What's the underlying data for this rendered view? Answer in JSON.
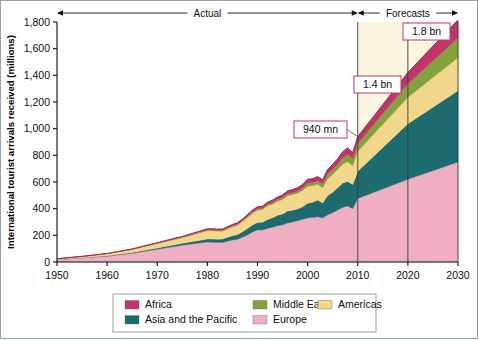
{
  "chart_data": {
    "type": "area",
    "stacked": true,
    "title": "",
    "xlabel": "",
    "ylabel": "International tourist arrivals received (millions)",
    "xlim": [
      1950,
      2030
    ],
    "ylim": [
      0,
      1800
    ],
    "grid": false,
    "legend_position": "bottom",
    "y_ticks": [
      "0",
      "200",
      "400",
      "600",
      "800",
      "1,000",
      "1,200",
      "1,400",
      "1,600",
      "1,800"
    ],
    "y_tick_values": [
      0,
      200,
      400,
      600,
      800,
      1000,
      1200,
      1400,
      1600,
      1800
    ],
    "x_ticks": [
      "1950",
      "1960",
      "1970",
      "1980",
      "1990",
      "2000",
      "2010",
      "2020",
      "2030"
    ],
    "x_tick_values": [
      1950,
      1960,
      1970,
      1980,
      1990,
      2000,
      2010,
      2020,
      2030
    ],
    "stack_order_bottom_to_top": [
      "Europe",
      "Asia and the Pacific",
      "Americas",
      "Middle East",
      "Africa"
    ],
    "x": [
      1950,
      1955,
      1960,
      1965,
      1970,
      1975,
      1980,
      1981,
      1982,
      1983,
      1984,
      1985,
      1986,
      1987,
      1988,
      1989,
      1990,
      1991,
      1992,
      1993,
      1994,
      1995,
      1996,
      1997,
      1998,
      1999,
      2000,
      2001,
      2002,
      2003,
      2004,
      2005,
      2006,
      2007,
      2008,
      2009,
      2010,
      2020,
      2030
    ],
    "series": [
      {
        "name": "Europe",
        "color": "#efafc2",
        "values": [
          17,
          30,
          43,
          65,
          95,
          125,
          150,
          148,
          147,
          147,
          156,
          165,
          170,
          185,
          203,
          225,
          240,
          240,
          252,
          260,
          272,
          278,
          293,
          300,
          310,
          320,
          330,
          334,
          340,
          330,
          354,
          370,
          390,
          410,
          420,
          400,
          476,
          620,
          750
        ]
      },
      {
        "name": "Asia and the Pacific",
        "color": "#1d6b6e",
        "values": [
          0.2,
          1,
          3,
          6,
          10,
          15,
          23,
          24,
          24,
          25,
          29,
          32,
          35,
          42,
          48,
          53,
          56,
          58,
          66,
          72,
          78,
          82,
          89,
          89,
          87,
          95,
          110,
          115,
          125,
          113,
          145,
          154,
          167,
          182,
          184,
          181,
          204,
          416,
          535
        ]
      },
      {
        "name": "Americas",
        "color": "#f2d78a",
        "values": [
          7,
          10,
          16,
          23,
          33,
          42,
          62,
          62,
          59,
          59,
          62,
          65,
          71,
          76,
          83,
          87,
          93,
          96,
          102,
          102,
          105,
          109,
          114,
          116,
          119,
          122,
          128,
          122,
          117,
          113,
          126,
          134,
          136,
          143,
          148,
          141,
          150,
          199,
          248
        ]
      },
      {
        "name": "Middle East",
        "color": "#84a23c",
        "values": [
          0.2,
          0.6,
          1,
          2,
          4,
          5,
          7,
          8,
          8,
          8,
          8,
          9,
          8,
          9,
          10,
          10,
          10,
          9,
          11,
          12,
          13,
          14,
          15,
          15,
          16,
          18,
          25,
          24,
          28,
          30,
          36,
          38,
          41,
          47,
          56,
          53,
          61,
          101,
          149
        ]
      },
      {
        "name": "Africa",
        "color": "#c2346c",
        "values": [
          0.5,
          0.8,
          1,
          2,
          3,
          5,
          7,
          8,
          8,
          8,
          9,
          10,
          10,
          10,
          12,
          14,
          15,
          16,
          18,
          18,
          19,
          20,
          22,
          23,
          25,
          26,
          28,
          29,
          30,
          31,
          34,
          37,
          41,
          45,
          47,
          46,
          49,
          85,
          134
        ]
      }
    ],
    "annotations": [
      {
        "label": "940 mn",
        "x": 2010,
        "y": 940
      },
      {
        "label": "1.4 bn",
        "x": 2020,
        "y": 1400
      },
      {
        "label": "1.8 bn",
        "x": 2030,
        "y": 1800
      }
    ],
    "period_markers": [
      {
        "label": "Actual",
        "from": 1950,
        "to": 2010
      },
      {
        "label": "Forecasts",
        "from": 2010,
        "to": 2030
      }
    ],
    "forecast_region": {
      "from": 2010,
      "to": 2030,
      "fill": "#fbf6dd"
    },
    "reference_lines": [
      2010,
      2020,
      2030
    ]
  },
  "legend": {
    "items": [
      {
        "label": "Africa",
        "color": "#c2346c"
      },
      {
        "label": "Middle East",
        "color": "#84a23c"
      },
      {
        "label": "Americas",
        "color": "#f2d78a"
      },
      {
        "label": "Asia and the Pacific",
        "color": "#1d6b6e"
      },
      {
        "label": "Europe",
        "color": "#efafc2"
      }
    ]
  },
  "colors": {
    "axis": "#101010",
    "callout_border": "#c2346c",
    "frame": "#9aa39c",
    "forecast_band": "#fbf6dd"
  }
}
